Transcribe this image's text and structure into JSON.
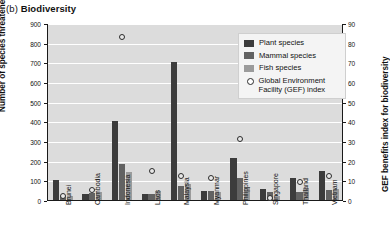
{
  "figure": {
    "panel_label": "(b)",
    "title": "Biodiversity"
  },
  "chart_data": {
    "type": "bar",
    "title": "(b) Biodiversity",
    "xlabel": "",
    "ylabel": "Number of species threatened (2014)",
    "y2label": "GEF benefits index for biodiversity",
    "ylim": [
      0,
      900
    ],
    "y2lim": [
      0,
      90
    ],
    "yticks": [
      0,
      100,
      200,
      300,
      400,
      500,
      600,
      700,
      800,
      900
    ],
    "y2ticks": [
      0,
      10,
      20,
      30,
      40,
      50,
      60,
      70,
      80,
      90
    ],
    "grid": true,
    "legend_position": "upper right",
    "categories": [
      "Brunei",
      "Cambodia",
      "Indonesia",
      "Laos",
      "Malaysia",
      "Myanmar",
      "Philippines",
      "Singapore",
      "Thailand",
      "Vietnam"
    ],
    "series": [
      {
        "name": "Plant species",
        "color": "#3c3c3c",
        "axis": "left",
        "values": [
          100,
          30,
          400,
          30,
          700,
          45,
          215,
          55,
          110,
          150
        ]
      },
      {
        "name": "Mammal species",
        "color": "#626262",
        "axis": "left",
        "values": [
          20,
          35,
          185,
          32,
          70,
          45,
          110,
          40,
          40,
          50
        ]
      },
      {
        "name": "Fish species",
        "color": "#9b9b9b",
        "axis": "left",
        "values": [
          22,
          42,
          140,
          45,
          80,
          42,
          65,
          20,
          60,
          55
        ]
      },
      {
        "name": "Global Environment Facility (GEF) index",
        "color": "#2a2a2a",
        "axis": "right",
        "marker": "open-circle",
        "values": [
          2,
          5,
          83,
          15,
          12,
          11,
          31,
          1,
          9,
          12
        ]
      }
    ]
  },
  "legend": {
    "items": [
      {
        "label": "Plant species",
        "type": "swatch",
        "color": "#3c3c3c"
      },
      {
        "label": "Mammal species",
        "type": "swatch",
        "color": "#626262"
      },
      {
        "label": "Fish species",
        "type": "swatch",
        "color": "#9b9b9b"
      },
      {
        "label": "Global Environment Facility (GEF) index",
        "type": "circle",
        "color": "#2a2a2a"
      }
    ]
  }
}
